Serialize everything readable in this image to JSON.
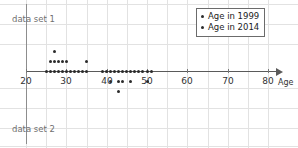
{
  "chart_data": {
    "type": "scatter",
    "title": "",
    "xlabel": "Age",
    "ylabel": "",
    "xlim": [
      20,
      80
    ],
    "xticks": [
      20,
      30,
      40,
      50,
      60,
      70,
      80
    ],
    "xticklabels": [
      "20",
      "30",
      "40",
      "50",
      "60",
      "70",
      "80"
    ],
    "grid": true,
    "legend_position": "top-right",
    "legend": [
      {
        "label": "Age in 1999",
        "marker": "dot"
      },
      {
        "label": "Age in 2014",
        "marker": "dot"
      }
    ],
    "annotations": [
      {
        "text": "data set 1",
        "position": "upper-left"
      },
      {
        "text": "data set 2",
        "position": "lower-left"
      }
    ],
    "series": [
      {
        "name": "Age in 1999",
        "dataset": "data set 1",
        "direction": "up",
        "description": "Stacked dot plot above the axis for ages 25-35",
        "values": [
          25,
          26,
          26,
          26,
          27,
          27,
          27,
          27,
          28,
          28,
          29,
          29,
          30,
          30,
          31,
          31,
          32,
          32,
          33,
          34,
          35,
          35
        ],
        "stacks": [
          {
            "age": 25,
            "count": 1
          },
          {
            "age": 26,
            "count": 2
          },
          {
            "age": 27,
            "count": 3
          },
          {
            "age": 28,
            "count": 2
          },
          {
            "age": 29,
            "count": 2
          },
          {
            "age": 30,
            "count": 2
          },
          {
            "age": 31,
            "count": 1
          },
          {
            "age": 32,
            "count": 1
          },
          {
            "age": 33,
            "count": 1
          },
          {
            "age": 34,
            "count": 1
          },
          {
            "age": 35,
            "count": 2
          }
        ]
      },
      {
        "name": "Age in 2014",
        "dataset": "data set 2",
        "direction": "down",
        "description": "Stacked dot plot below the axis for ages 39-51",
        "values": [
          39,
          40,
          41,
          41,
          42,
          42,
          43,
          43,
          43,
          44,
          44,
          45,
          46,
          46,
          47,
          47,
          48,
          49,
          50,
          51,
          51
        ],
        "stacks": [
          {
            "age": 39,
            "count": 1
          },
          {
            "age": 40,
            "count": 1
          },
          {
            "age": 41,
            "count": 2
          },
          {
            "age": 42,
            "count": 1
          },
          {
            "age": 43,
            "count": 3
          },
          {
            "age": 44,
            "count": 2
          },
          {
            "age": 45,
            "count": 1
          },
          {
            "age": 46,
            "count": 2
          },
          {
            "age": 47,
            "count": 1
          },
          {
            "age": 48,
            "count": 1
          },
          {
            "age": 49,
            "count": 1
          },
          {
            "age": 50,
            "count": 2
          },
          {
            "age": 51,
            "count": 1
          }
        ]
      }
    ]
  },
  "colors": {
    "dot": "#2b2b2b",
    "axis": "#5a5a5a",
    "grid": "#e2e2e2",
    "label": "#6f6f6f"
  }
}
